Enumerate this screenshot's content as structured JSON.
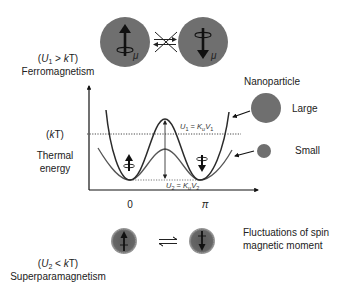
{
  "colors": {
    "sphere_fill": "#6f6f6f",
    "curve_stroke": "#2b2b2b",
    "small_curve_stroke": "#555555",
    "axis": "#111111",
    "text": "#222222",
    "background": "#ffffff"
  },
  "ferro": {
    "condition": "(U₁ > kT)",
    "condition_parts": {
      "open": "(",
      "U": "U",
      "sub": "1",
      "rel": " > ",
      "k": "k",
      "T": "T)"
    },
    "label": "Ferromagnetism",
    "moment_symbol": "μ"
  },
  "energy_axis": {
    "kT_label": "(kT)",
    "kT_parts": {
      "open": "(",
      "k": "k",
      "rest": "T)"
    },
    "thermal_line1": "Thermal",
    "thermal_line2": "energy",
    "x_ticks": [
      "0",
      "π"
    ]
  },
  "barriers": {
    "u1": "U₁ = KᵤV₁",
    "u1_parts": {
      "U": "U",
      "sub": "1",
      "eq": " = K",
      "ksub": "u",
      "V": "V",
      "vsub": "1"
    },
    "u2": "U₂ = KᵤV₂",
    "u2_parts": {
      "U": "U",
      "sub": "2",
      "eq": " = K",
      "ksub": "u",
      "V": "V",
      "vsub": "2"
    }
  },
  "nanoparticle": {
    "title": "Nanoparticle",
    "large_label": "Large",
    "small_label": "Small"
  },
  "superpara": {
    "condition": "(U₂ < kT)",
    "condition_parts": {
      "open": "(",
      "U": "U",
      "sub": "2",
      "rel": " < ",
      "k": "k",
      "T": "T)"
    },
    "label": "Superparamagnetism",
    "fluct_line1": "Fluctuations of spin",
    "fluct_line2": "magnetic moment"
  },
  "icons": {
    "spin_up": "spin-up-arrow-icon",
    "spin_down": "spin-down-arrow-icon",
    "blocked_transition": "crossed-equilibrium-arrows-icon",
    "equilibrium": "equilibrium-arrows-icon"
  }
}
